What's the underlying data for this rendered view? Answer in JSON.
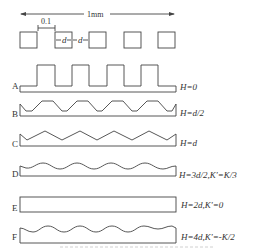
{
  "figure": {
    "scale_label": "1mm",
    "gap_label": "0.1",
    "width_label": "d",
    "spacing_label": "d",
    "square_count": 5,
    "stroke_color": "#444444",
    "background": "#ffffff"
  },
  "rows": [
    {
      "label": "A",
      "equation": "H=0",
      "shape": "square-wave"
    },
    {
      "label": "B",
      "equation": "H=d/2",
      "shape": "trapezoid-wave"
    },
    {
      "label": "C",
      "equation": "H=d",
      "shape": "triangle-wave"
    },
    {
      "label": "D",
      "equation": "H=3d/2,K'=K/3",
      "shape": "sine-wave"
    },
    {
      "label": "E",
      "equation": "H=2d,K'=0",
      "shape": "flat"
    },
    {
      "label": "F",
      "equation": "H=4d,K'=-K/2",
      "shape": "inverted-sine-wave"
    }
  ],
  "caption": ""
}
